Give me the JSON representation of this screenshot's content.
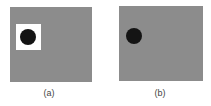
{
  "figure": {
    "panels": [
      {
        "id": "a",
        "label": "(a)",
        "background": "#8c8c8c",
        "has_white_square": true,
        "dot_color": "#141414"
      },
      {
        "id": "b",
        "label": "(b)",
        "background": "#8c8c8c",
        "has_white_square": false,
        "dot_color": "#141414"
      }
    ]
  }
}
